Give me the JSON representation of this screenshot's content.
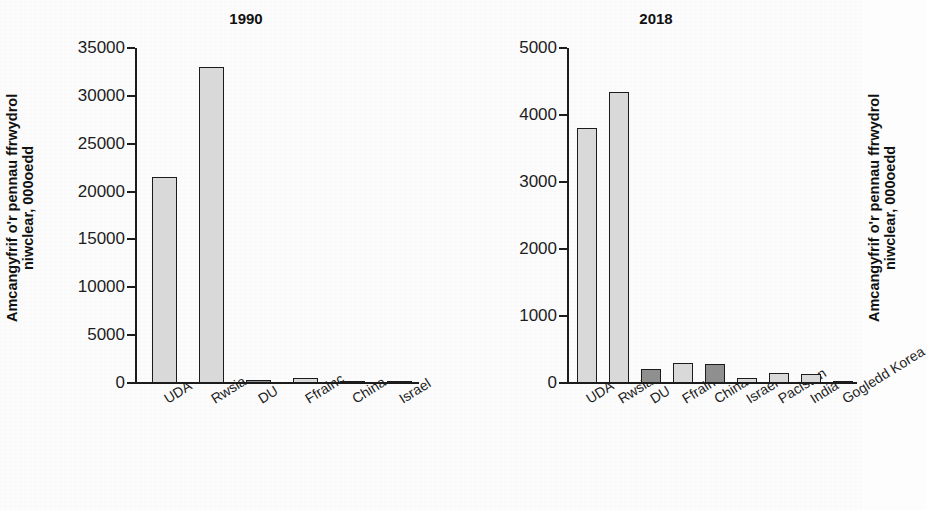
{
  "figure": {
    "ylabel": "Amcangyfrif o'r pennau ffrwydrol\nniwclear, 000oedd",
    "colors": {
      "bar_light": "#d9d9d9",
      "bar_dark": "#8f8f8f",
      "outline": "#1c1c1c",
      "background": "#fdfdfd"
    }
  },
  "chart_data": [
    {
      "type": "bar",
      "title": "1990",
      "xlabel": "",
      "ylabel": "Amcangyfrif o'r pennau ffrwydrol niwclear, 000oedd",
      "ylim": [
        0,
        35000
      ],
      "yticks": [
        0,
        5000,
        10000,
        15000,
        20000,
        25000,
        30000,
        35000
      ],
      "ytick_labels": [
        "0",
        "5000",
        "10000",
        "15000",
        "20000",
        "25000",
        "30000",
        "35000"
      ],
      "grid": false,
      "legend": "none",
      "categories": [
        "UDA",
        "Rwsia",
        "DU",
        "Ffrainc",
        "China",
        "Israel"
      ],
      "values": [
        21500,
        33000,
        350,
        505,
        232,
        53
      ],
      "bar_shades": [
        "light",
        "light",
        "dark",
        "light",
        "dark",
        "light"
      ]
    },
    {
      "type": "bar",
      "title": "2018",
      "xlabel": "",
      "ylabel": "Amcangyfrif o'r pennau ffrwydrol niwclear, 000oedd",
      "ylim": [
        0,
        5000
      ],
      "yticks": [
        0,
        1000,
        2000,
        3000,
        4000,
        5000
      ],
      "ytick_labels": [
        "0",
        "1000",
        "2000",
        "3000",
        "4000",
        "5000"
      ],
      "grid": false,
      "legend": "none",
      "categories": [
        "UDA",
        "Rwsia",
        "DU",
        "Ffrainc",
        "China",
        "Israel",
        "Pacistan",
        "India",
        "Gogledd Korea"
      ],
      "values": [
        3800,
        4350,
        215,
        300,
        280,
        80,
        145,
        135,
        30
      ],
      "bar_shades": [
        "light",
        "light",
        "dark",
        "light",
        "dark",
        "light",
        "light",
        "light",
        "light"
      ]
    }
  ],
  "panels": {
    "left": {
      "title": "1990",
      "ylabel": "Amcangyfrif o'r pennau ffrwydrol\nniwclear, 000oedd"
    },
    "right": {
      "title": "2018",
      "ylabel": "Amcangyfrif o'r pennau ffrwydrol\nniwclear, 000oedd"
    }
  }
}
